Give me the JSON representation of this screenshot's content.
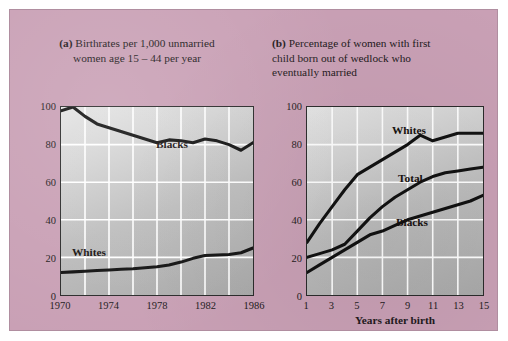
{
  "figure": {
    "background_color": "#c9a0b5",
    "border_color": "#b08ea0"
  },
  "panel_a": {
    "tag": "(a)",
    "caption": "Birthrates per 1,000 unmarried women age 15 – 44 per year",
    "caption_line1": "Birthrates per 1,000 unmarried",
    "caption_line2": "women age 15 – 44 per year",
    "series_labels": {
      "blacks": "Blacks",
      "whites": "Whites"
    },
    "y_ticks": [
      "0",
      "20",
      "40",
      "60",
      "80",
      "100"
    ],
    "x_ticks": [
      "1970",
      "1974",
      "1978",
      "1982",
      "1986"
    ]
  },
  "panel_b": {
    "tag": "(b)",
    "caption": "Percentage of women with first child born out of wedlock who eventually married",
    "caption_line1": "Percentage of women with first",
    "caption_line2": "child born out of wedlock who",
    "caption_line3": "eventually married",
    "series_labels": {
      "whites": "Whites",
      "total": "Total",
      "blacks": "Blacks"
    },
    "y_ticks": [
      "0",
      "20",
      "40",
      "60",
      "80",
      "100"
    ],
    "x_ticks": [
      "1",
      "3",
      "5",
      "7",
      "9",
      "11",
      "13",
      "15"
    ],
    "x_axis_title": "Years after birth"
  },
  "chart_data": [
    {
      "type": "line",
      "title": "(a) Birthrates per 1,000 unmarried women age 15 – 44 per year",
      "xlabel": "",
      "ylabel": "",
      "xlim": [
        1970,
        1986
      ],
      "ylim": [
        0,
        100
      ],
      "yticks": [
        0,
        20,
        40,
        60,
        80,
        100
      ],
      "xticks": [
        1970,
        1974,
        1978,
        1982,
        1986
      ],
      "grid": true,
      "legend": "inline-labels",
      "x": [
        1970,
        1971,
        1972,
        1973,
        1974,
        1975,
        1976,
        1977,
        1978,
        1979,
        1980,
        1981,
        1982,
        1983,
        1984,
        1985,
        1986
      ],
      "series": [
        {
          "name": "Blacks",
          "values": [
            98,
            100,
            95,
            91,
            89,
            87,
            85,
            83,
            81,
            82.5,
            82,
            81,
            83,
            82,
            80,
            77,
            81
          ]
        },
        {
          "name": "Whites",
          "values": [
            12,
            12.3,
            12.6,
            13,
            13.3,
            13.7,
            14,
            14.5,
            15,
            16,
            17.5,
            19.5,
            21,
            21.3,
            21.5,
            22.5,
            25
          ]
        }
      ]
    },
    {
      "type": "line",
      "title": "(b) Percentage of women with first child born out of wedlock who eventually married",
      "xlabel": "Years after birth",
      "ylabel": "",
      "xlim": [
        1,
        15
      ],
      "ylim": [
        0,
        100
      ],
      "yticks": [
        0,
        20,
        40,
        60,
        80,
        100
      ],
      "xticks": [
        1,
        3,
        5,
        7,
        9,
        11,
        13,
        15
      ],
      "grid": true,
      "legend": "inline-labels",
      "x": [
        1,
        2,
        3,
        4,
        5,
        6,
        7,
        8,
        9,
        10,
        11,
        12,
        13,
        14,
        15
      ],
      "series": [
        {
          "name": "Whites",
          "values": [
            28,
            38,
            47,
            56,
            64,
            68,
            72,
            76,
            80,
            85,
            82,
            84,
            86,
            86,
            86
          ]
        },
        {
          "name": "Total",
          "values": [
            20,
            22,
            24,
            27,
            34,
            41,
            47,
            52,
            56,
            60,
            63,
            65,
            66,
            67,
            68
          ]
        },
        {
          "name": "Blacks",
          "values": [
            12,
            16,
            20,
            24,
            28,
            32,
            34,
            37,
            40,
            42,
            44,
            46,
            48,
            50,
            53
          ]
        }
      ]
    }
  ]
}
